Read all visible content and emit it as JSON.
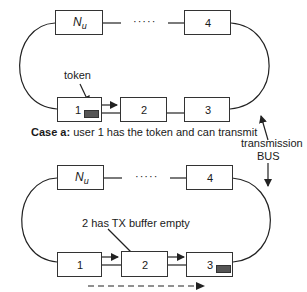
{
  "diagram": {
    "case_a": {
      "nodes": [
        {
          "id": "nu",
          "label_main": "N",
          "label_sub": "u"
        },
        {
          "id": "4",
          "label": "4"
        },
        {
          "id": "1",
          "label": "1"
        },
        {
          "id": "2",
          "label": "2"
        },
        {
          "id": "3",
          "label": "3"
        }
      ],
      "dots": "·····",
      "token_label": "token",
      "caption_bold": "Case a:",
      "caption_text": " user 1 has the token and can transmit"
    },
    "case_b": {
      "nodes": [
        {
          "id": "nu",
          "label_main": "N",
          "label_sub": "u"
        },
        {
          "id": "4",
          "label": "4"
        },
        {
          "id": "1",
          "label": "1"
        },
        {
          "id": "2",
          "label": "2"
        },
        {
          "id": "3",
          "label": "3"
        }
      ],
      "dots": "·····",
      "annotation": "2 has TX buffer empty"
    },
    "bus_label_line1": "transmission",
    "bus_label_line2": "BUS",
    "colors": {
      "line": "#222222",
      "token": "#555555"
    }
  }
}
